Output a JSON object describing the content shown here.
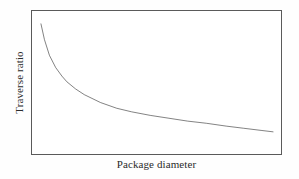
{
  "figure": {
    "background_color": "#fefefe",
    "frame_color": "#5a5a5a",
    "curve_color": "#1c1c1c",
    "text_color": "#2b2b2b"
  },
  "chart_data": {
    "type": "line",
    "title": "",
    "subtitle": "",
    "xlabel": "Package diameter",
    "ylabel": "Traverse ratio",
    "legend": [],
    "annotations": [],
    "grid": false,
    "xticks": [],
    "yticks": [],
    "xlim": [
      0,
      100
    ],
    "ylim": [
      0,
      100
    ],
    "series": [
      {
        "name": "traverse ratio vs package diameter",
        "description": "Monotonically decreasing hyperbolic decay curve, steep at small diameters and flattening toward large diameters",
        "x": [
          3.6,
          5.0,
          7.0,
          9.5,
          12.0,
          14.0,
          17.5,
          21.0,
          27.5,
          34.0,
          40.0,
          47.5,
          55.0,
          62.5,
          70.0,
          78.0,
          85.0,
          92.0,
          96.8
        ],
        "y": [
          91.0,
          80.0,
          69.0,
          60.5,
          54.5,
          50.5,
          45.5,
          41.5,
          36.0,
          32.0,
          29.5,
          27.0,
          25.0,
          23.0,
          21.5,
          19.5,
          18.0,
          16.5,
          15.5
        ]
      }
    ]
  }
}
